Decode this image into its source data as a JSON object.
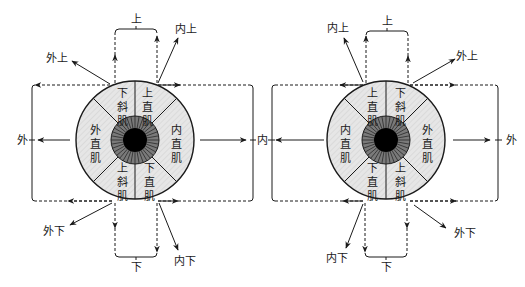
{
  "diagram": {
    "title": "",
    "eyes": [
      {
        "id": "left-eye",
        "center": [
          135,
          140
        ],
        "radius": 59,
        "muscles": {
          "upper_left": [
            "下",
            "斜",
            "肌"
          ],
          "upper_right": [
            "上",
            "直",
            "肌"
          ],
          "left": [
            "外",
            "直",
            "肌"
          ],
          "right": [
            "内",
            "直",
            "肌"
          ],
          "lower_left": [
            "上",
            "斜",
            "肌"
          ],
          "lower_right": [
            "下",
            "直",
            "肌"
          ]
        },
        "direction_labels": {
          "up": "上",
          "down": "下",
          "left": "外",
          "right": "内",
          "up_left": "外上",
          "up_right": "内上",
          "down_left": "外下",
          "down_right": "内下"
        }
      },
      {
        "id": "right-eye",
        "center": [
          386,
          140
        ],
        "radius": 59,
        "muscles": {
          "upper_left": [
            "上",
            "直",
            "肌"
          ],
          "upper_right": [
            "下",
            "斜",
            "肌"
          ],
          "left": [
            "内",
            "直",
            "肌"
          ],
          "right": [
            "外",
            "直",
            "肌"
          ],
          "lower_left": [
            "下",
            "直",
            "肌"
          ],
          "lower_right": [
            "上",
            "斜",
            "肌"
          ]
        },
        "direction_labels": {
          "up": "上",
          "down": "下",
          "left": "内",
          "right": "外",
          "up_left": "内上",
          "up_right": "外上",
          "down_left": "内下",
          "down_right": "外下"
        }
      }
    ],
    "shared_center_label": "内",
    "colors": {
      "sector_fill": "#e4e4e4",
      "iris_fill": "#6e6e6e",
      "pupil": "#000000",
      "line": "#1a1a1a"
    }
  }
}
